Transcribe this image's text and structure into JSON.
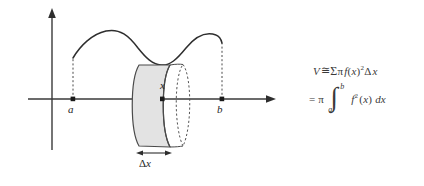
{
  "figure": {
    "background_color": "#ffffff",
    "ink_color": "#333333",
    "shade_color": "#e3e3e3"
  },
  "diagram": {
    "axes": {
      "x_axis_name": "x-axis",
      "y_axis_name": "y-axis",
      "x_axis_has_arrow": true,
      "y_axis_has_arrow": true
    },
    "curve_label": "f(x)",
    "labels": {
      "a": "a",
      "b": "b",
      "x": "x",
      "delta_x_symbol": "Δ",
      "delta_x_var": "x"
    },
    "points": [
      {
        "name": "a",
        "label": "a",
        "position": "left endpoint on x-axis"
      },
      {
        "name": "x",
        "label": "x",
        "position": "sample point on x-axis"
      },
      {
        "name": "b",
        "label": "b",
        "position": "right endpoint on x-axis"
      }
    ],
    "slab": {
      "name": "representative-disk",
      "fill": "#e3e3e3",
      "width_label": "Δx",
      "back_edge_style": "dashed ellipse"
    }
  },
  "formulas": {
    "line1": {
      "V": "V",
      "approx": "≅",
      "sigma": "Σ",
      "pi": "π",
      "f": "f",
      "open": "(",
      "x": "x",
      "close": ")",
      "square": "2",
      "delta": "Δ",
      "dx_var": "x"
    },
    "line2": {
      "equals": "=",
      "pi": "π",
      "integral": "∫",
      "upper_limit": "b",
      "lower_limit": "a",
      "f": "f",
      "square": "2",
      "open": "(",
      "x": "x",
      "close": ")",
      "differential": "dx"
    }
  }
}
